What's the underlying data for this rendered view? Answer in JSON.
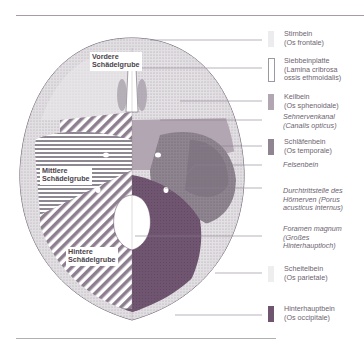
{
  "diagram": {
    "fossae": [
      {
        "id": "vordere",
        "line1": "Vordere",
        "line2": "Schädelgrube"
      },
      {
        "id": "mittlere",
        "line1": "Mittlere",
        "line2": "Schädelgrube"
      },
      {
        "id": "hintere",
        "line1": "Hintere",
        "line2": "Schädelgrube"
      }
    ],
    "legend": [
      {
        "id": "stirnbein",
        "text": "Stirnbein\n(Os frontale)",
        "swatch": "#ecebed",
        "italic": false
      },
      {
        "id": "siebbeinplatte",
        "text": "Siebbeinplatte\n(Lamina cribrosa\nossis ethmoidalis)",
        "swatch": "#ffffff",
        "italic": false
      },
      {
        "id": "keilbein",
        "text": "Keilbein\n(Os sphenoidale)",
        "swatch": "#b2a6b3",
        "italic": false
      },
      {
        "id": "sehnervenkanal",
        "text": "Sehnervenkanal\n(Canalis opticus)",
        "swatch": null,
        "italic": true
      },
      {
        "id": "schlaefenbein",
        "text": "Schläfenbein\n(Os temporale)",
        "swatch": "#8f8591",
        "italic": false
      },
      {
        "id": "felsenbein",
        "text": "Felsenbein",
        "swatch": null,
        "italic": true
      },
      {
        "id": "hoernerven",
        "text": "Durchtrittstelle des\nHörnerven (Porus\nacusticus internus)",
        "swatch": null,
        "italic": true
      },
      {
        "id": "foramen",
        "text": "Foramen magnum\n(Großes\nHinterhauptloch)",
        "swatch": null,
        "italic": true
      },
      {
        "id": "scheitelbein",
        "text": "Scheitelbein\n(Os parietale)",
        "swatch": "#efeeef",
        "italic": false
      },
      {
        "id": "hinterhauptbein",
        "text": "Hinterhauptbein\n(Os occipitale)",
        "swatch": "#6f5570",
        "italic": false
      }
    ],
    "colors": {
      "occipital": "#6f5570",
      "temporal": "#8f8591",
      "sphenoid": "#b2a6b3",
      "frontal": "#d9d6da",
      "rule": "#a89aa6"
    }
  }
}
